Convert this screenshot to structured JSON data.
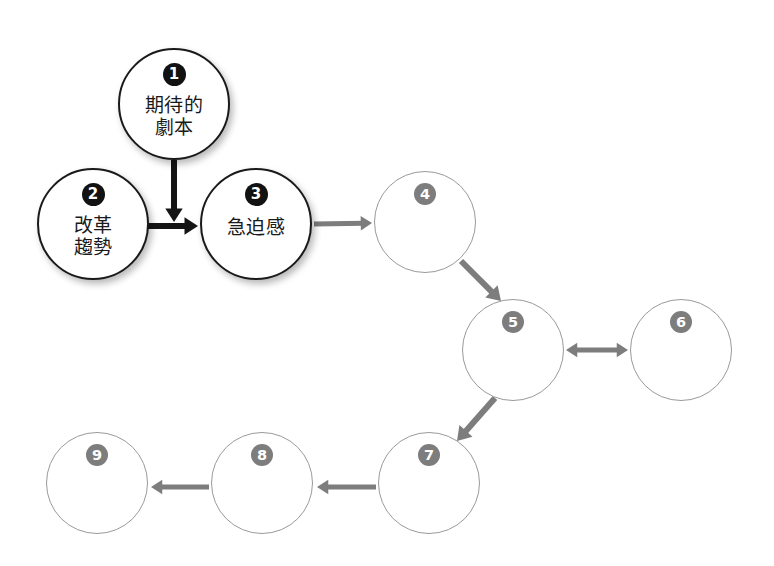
{
  "diagram": {
    "title": "",
    "background_color": "#ffffff",
    "dark_stroke_color": "#1a1a1a",
    "gray_stroke_color": "#9a9a9a",
    "dark_badge_color": "#121212",
    "gray_badge_color": "#7d7d7d",
    "dark_arrow_color": "#141414",
    "gray_arrow_color": "#7d7d7d",
    "nodes": [
      {
        "id": "1",
        "number": "1",
        "label": "期待的\n劇本",
        "style": "dark",
        "cx": 174,
        "cy": 104,
        "r": 56,
        "badge_offset": 22,
        "label_top": 44
      },
      {
        "id": "2",
        "number": "2",
        "label": "改革\n趨勢",
        "style": "dark",
        "cx": 93,
        "cy": 224,
        "r": 56,
        "badge_offset": 22,
        "label_top": 44
      },
      {
        "id": "3",
        "number": "3",
        "label": "急迫感",
        "style": "dark",
        "cx": 256,
        "cy": 224,
        "r": 56,
        "badge_offset": 22,
        "label_top": 46
      },
      {
        "id": "4",
        "number": "4",
        "label": "",
        "style": "gray",
        "cx": 425,
        "cy": 222,
        "r": 51,
        "badge_offset": 18,
        "label_top": 0
      },
      {
        "id": "5",
        "number": "5",
        "label": "",
        "style": "gray",
        "cx": 513,
        "cy": 350,
        "r": 51,
        "badge_offset": 18,
        "label_top": 0
      },
      {
        "id": "6",
        "number": "6",
        "label": "",
        "style": "gray",
        "cx": 681,
        "cy": 350,
        "r": 51,
        "badge_offset": 18,
        "label_top": 0
      },
      {
        "id": "7",
        "number": "7",
        "label": "",
        "style": "gray",
        "cx": 429,
        "cy": 483,
        "r": 51,
        "badge_offset": 18,
        "label_top": 0
      },
      {
        "id": "8",
        "number": "8",
        "label": "",
        "style": "gray",
        "cx": 262,
        "cy": 483,
        "r": 51,
        "badge_offset": 18,
        "label_top": 0
      },
      {
        "id": "9",
        "number": "9",
        "label": "",
        "style": "gray",
        "cx": 97,
        "cy": 483,
        "r": 51,
        "badge_offset": 18,
        "label_top": 0
      }
    ],
    "edges": [
      {
        "id": "e1",
        "from": "1",
        "to": "2-3-link",
        "direction": "one-way",
        "color": "#141414",
        "width": 6,
        "x1": 174,
        "y1": 160,
        "x2": 174,
        "y2": 222
      },
      {
        "id": "e2",
        "from": "2",
        "to": "3",
        "direction": "one-way",
        "color": "#141414",
        "width": 6,
        "x1": 148,
        "y1": 226,
        "x2": 198,
        "y2": 226
      },
      {
        "id": "e3",
        "from": "3",
        "to": "4",
        "direction": "one-way",
        "color": "#7d7d7d",
        "width": 5,
        "x1": 314,
        "y1": 224,
        "x2": 372,
        "y2": 223
      },
      {
        "id": "e4",
        "from": "4",
        "to": "5",
        "direction": "one-way",
        "color": "#7d7d7d",
        "width": 6,
        "x1": 461,
        "y1": 261,
        "x2": 501,
        "y2": 301
      },
      {
        "id": "e5",
        "from": "5",
        "to": "6",
        "direction": "two-way",
        "color": "#7d7d7d",
        "width": 5,
        "x1": 566,
        "y1": 350,
        "x2": 628,
        "y2": 350
      },
      {
        "id": "e6",
        "from": "5",
        "to": "7",
        "direction": "one-way",
        "color": "#7d7d7d",
        "width": 6,
        "x1": 495,
        "y1": 398,
        "x2": 457,
        "y2": 441
      },
      {
        "id": "e7",
        "from": "7",
        "to": "8",
        "direction": "one-way",
        "color": "#7d7d7d",
        "width": 5,
        "x1": 376,
        "y1": 487,
        "x2": 317,
        "y2": 487
      },
      {
        "id": "e8",
        "from": "8",
        "to": "9",
        "direction": "one-way",
        "color": "#7d7d7d",
        "width": 5,
        "x1": 209,
        "y1": 487,
        "x2": 151,
        "y2": 487
      }
    ]
  }
}
